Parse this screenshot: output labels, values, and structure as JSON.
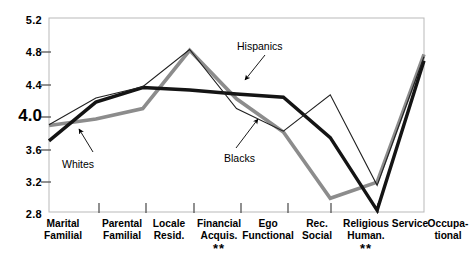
{
  "chart_data": {
    "type": "line",
    "title": "",
    "subtitle": "",
    "xlabel": "",
    "ylabel": "",
    "ylim": [
      2.8,
      5.2
    ],
    "yticks": [
      "2.8",
      "3.2",
      "3.6",
      "4.0",
      "4.4",
      "4.8",
      "5.2"
    ],
    "ytick_emphasis": "4.0",
    "grid": false,
    "legend_position": "inline-annotations",
    "categories": [
      {
        "line1": "Marital",
        "line2": "Familial",
        "significance": ""
      },
      {
        "line1": "Parental",
        "line2": "Familial",
        "significance": ""
      },
      {
        "line1": "Locale",
        "line2": "Resid.",
        "significance": ""
      },
      {
        "line1": "Financial",
        "line2": "Acquis.",
        "significance": "**"
      },
      {
        "line1": "Ego",
        "line2": "Functional",
        "significance": ""
      },
      {
        "line1": "Rec.",
        "line2": "Social",
        "significance": ""
      },
      {
        "line1": "Religious",
        "line2": "Human.",
        "significance": "**"
      },
      {
        "line1": "Service",
        "line2": "",
        "significance": ""
      },
      {
        "line1": "Occupa-",
        "line2": "tional",
        "significance": ""
      }
    ],
    "series": [
      {
        "name": "Whites",
        "style": "thick-black",
        "color": "#141414",
        "values": [
          3.68,
          4.16,
          4.34,
          4.31,
          4.26,
          4.22,
          3.72,
          2.82,
          4.67
        ]
      },
      {
        "name": "Blacks",
        "style": "thin-black",
        "color": "#202020",
        "values": [
          3.88,
          4.21,
          4.35,
          4.81,
          4.08,
          3.8,
          4.25,
          3.13,
          4.72
        ]
      },
      {
        "name": "Hispanics",
        "style": "thick-gray",
        "color": "#8c8c8c",
        "values": [
          3.87,
          3.95,
          4.08,
          4.8,
          4.2,
          3.79,
          2.97,
          3.17,
          4.75
        ]
      }
    ],
    "annotations": [
      {
        "label": "Whites",
        "x": 62,
        "y": 158
      },
      {
        "label": "Blacks",
        "x": 224,
        "y": 152
      },
      {
        "label": "Hispanics",
        "x": 237,
        "y": 46
      }
    ]
  }
}
